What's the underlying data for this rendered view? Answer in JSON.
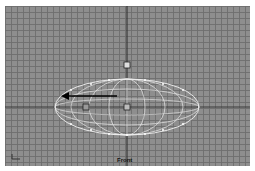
{
  "viewport": {
    "label": "Front",
    "background_color": "#8e8e8e",
    "grid_color": "#6e6e6e",
    "wireframe_color": "#f0f0f0",
    "arrow_color": "#000000"
  },
  "scene": {
    "object": "ellipsoid-wireframe",
    "center": [
      122,
      101
    ],
    "radius_x": 72,
    "radius_y": 28,
    "handles": [
      "top-handle",
      "center-handle",
      "left-handle"
    ]
  },
  "icons": [
    "arrow-left-icon",
    "axis-tripod-icon",
    "gizmo-handle-icon"
  ]
}
